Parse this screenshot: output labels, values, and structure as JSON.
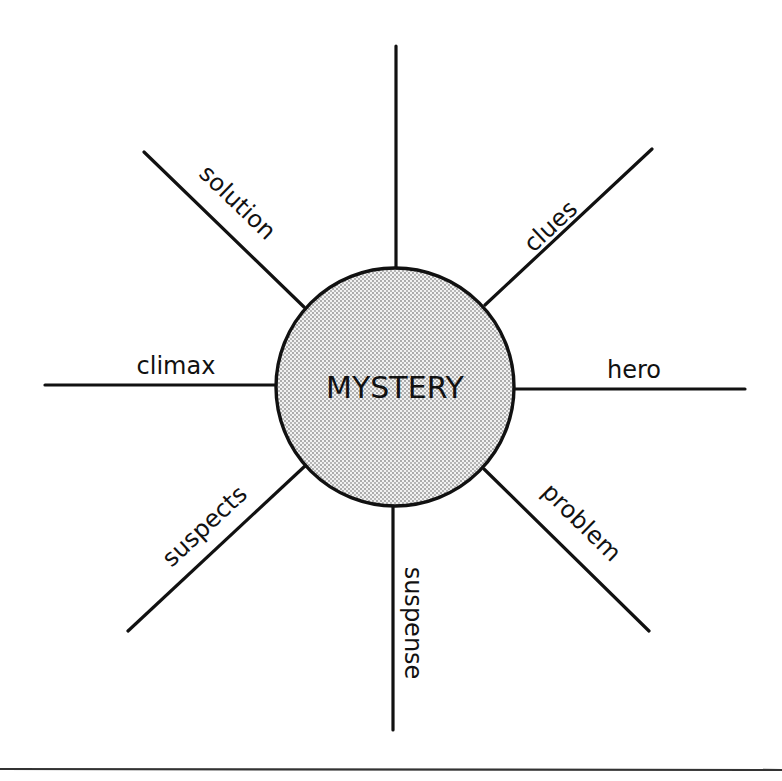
{
  "diagram": {
    "type": "spider-map",
    "center": {
      "label": "MYSTERY",
      "fill_color": "#d9d9d9",
      "stroke_color": "#111111"
    },
    "spokes": [
      {
        "position": "top",
        "label": ""
      },
      {
        "position": "top-right",
        "label": "clues"
      },
      {
        "position": "right",
        "label": "hero"
      },
      {
        "position": "bottom-right",
        "label": "problem"
      },
      {
        "position": "bottom",
        "label": "suspense"
      },
      {
        "position": "bottom-left",
        "label": "suspects"
      },
      {
        "position": "left",
        "label": "climax"
      },
      {
        "position": "top-left",
        "label": "solution"
      }
    ],
    "line_color": "#111111",
    "background": "#ffffff"
  }
}
